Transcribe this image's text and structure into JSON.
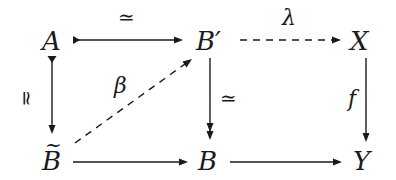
{
  "diagram": {
    "type": "commutative-diagram",
    "nodes": {
      "A": "A",
      "Bprime": "B′",
      "X": "X",
      "Btilde": "B",
      "Btilde_accent": "~",
      "B": "B",
      "Y": "Y"
    },
    "edges": [
      {
        "from": "A",
        "to": "B′",
        "label": "≃",
        "style": "solid",
        "tail": "cofibration"
      },
      {
        "from": "B′",
        "to": "X",
        "label": "λ",
        "style": "dashed"
      },
      {
        "from": "A",
        "to": "B̃",
        "label": "≃",
        "style": "solid",
        "tail": "cofibration"
      },
      {
        "from": "B̃",
        "to": "B′",
        "label": "β",
        "style": "dashed"
      },
      {
        "from": "B′",
        "to": "B",
        "label": "≃",
        "style": "solid",
        "head": "fibration"
      },
      {
        "from": "X",
        "to": "Y",
        "label": "f",
        "style": "solid"
      },
      {
        "from": "B̃",
        "to": "B",
        "label": "",
        "style": "solid"
      },
      {
        "from": "B",
        "to": "Y",
        "label": "",
        "style": "solid"
      }
    ],
    "labels": {
      "top_left": "≃",
      "top_right": "λ",
      "left": "≃",
      "diagonal": "β",
      "middle": "≃",
      "right": "f"
    }
  }
}
